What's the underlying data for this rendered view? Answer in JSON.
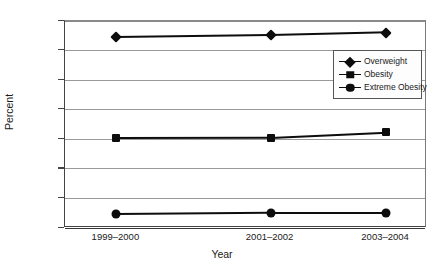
{
  "chart_data": {
    "type": "line",
    "title": "",
    "xlabel": "Year",
    "ylabel": "Percent",
    "categories": [
      "1999–2000",
      "2001–2002",
      "2003–2004"
    ],
    "ylim": [
      0,
      70
    ],
    "yticks": [
      0,
      10,
      20,
      30,
      40,
      50,
      60,
      70
    ],
    "ytick_labels": [
      "0",
      "10",
      "20",
      "30",
      "40",
      "50",
      "60",
      "70"
    ],
    "grid": true,
    "legend_position": "upper right",
    "series": [
      {
        "name": "Overweight",
        "marker": "diamond",
        "color": "#0d0d0d",
        "values": [
          64.5,
          65.2,
          66.1
        ]
      },
      {
        "name": "Obesity",
        "marker": "square",
        "color": "#0d0d0d",
        "values": [
          30.5,
          30.6,
          32.4
        ]
      },
      {
        "name": "Extreme Obesity",
        "marker": "circle",
        "color": "#0d0d0d",
        "values": [
          4.7,
          5.1,
          5.1
        ]
      }
    ]
  }
}
